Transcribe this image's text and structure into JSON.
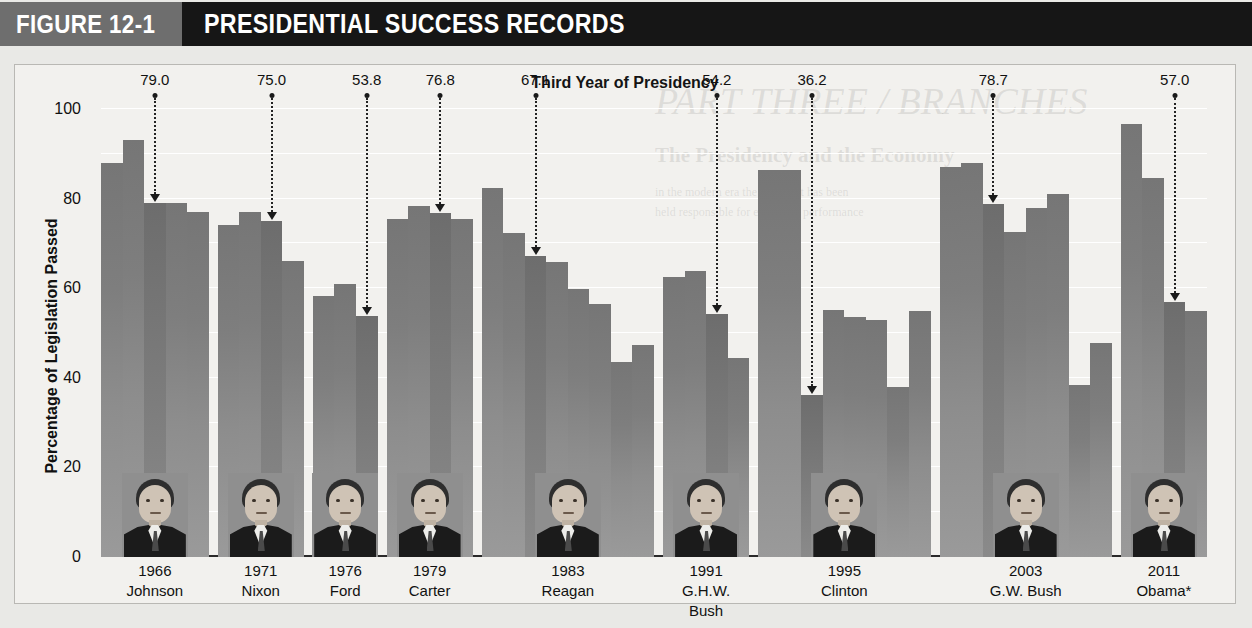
{
  "header": {
    "figure_number": "FIGURE 12-1",
    "figure_title": "PRESIDENTIAL SUCCESS RECORDS",
    "num_block_color": "#6e6e6e",
    "title_block_color": "#161616"
  },
  "background_text": {
    "line1": "PART THREE / BRANCHES",
    "line2": "The Presidency and the Economy",
    "line3": "in the modern era the president has been",
    "line4": "held responsible for economic performance"
  },
  "chart_data": {
    "type": "bar",
    "title": "Third Year of Presidency",
    "xlabel": "",
    "ylabel": "Percentage of Legislation Passed",
    "ylim": [
      0,
      100
    ],
    "yticks": [
      0,
      20,
      40,
      60,
      80,
      100
    ],
    "grid": true,
    "gridlines_minor": [
      10,
      30,
      50,
      70,
      90
    ],
    "legend_position": "none",
    "bar_color": "#8a8a8a",
    "footnote_marker": "*",
    "groups": [
      {
        "year": "1966",
        "president": "Johnson",
        "highlight_index": 2,
        "highlight_value": 79.0,
        "values": [
          88.0,
          93.0,
          79.0,
          79.0,
          77.0
        ]
      },
      {
        "year": "1971",
        "president": "Nixon",
        "highlight_index": 2,
        "highlight_value": 75.0,
        "values": [
          74.0,
          77.0,
          75.0,
          66.0
        ]
      },
      {
        "year": "1976",
        "president": "Ford",
        "highlight_index": 2,
        "highlight_value": 53.8,
        "values": [
          58.2,
          61.0,
          53.8
        ]
      },
      {
        "year": "1979",
        "president": "Carter",
        "highlight_index": 2,
        "highlight_value": 76.8,
        "values": [
          75.4,
          78.3,
          76.8,
          75.4
        ]
      },
      {
        "year": "1983",
        "president": "Reagan",
        "highlight_index": 2,
        "highlight_value": 67.1,
        "values": [
          82.4,
          72.4,
          67.1,
          65.8,
          59.9,
          56.5,
          43.5,
          47.4
        ]
      },
      {
        "year": "1991",
        "president": "G.H.W. Bush",
        "highlight_index": 2,
        "highlight_value": 54.2,
        "values": [
          62.6,
          63.9,
          54.2,
          44.5
        ]
      },
      {
        "year": "1995",
        "president": "Clinton",
        "highlight_index": 2,
        "highlight_value": 36.2,
        "values": [
          86.4,
          86.4,
          36.2,
          55.1,
          53.6,
          52.9,
          38.0,
          55.0
        ]
      },
      {
        "year": "2003",
        "president": "G.W. Bush",
        "highlight_index": 2,
        "highlight_value": 78.7,
        "values": [
          87.0,
          88.0,
          78.7,
          72.6,
          78.0,
          81.0,
          38.3,
          47.8
        ]
      },
      {
        "year": "2011",
        "president": "Obama*",
        "highlight_index": 2,
        "highlight_value": 57.0,
        "values": [
          96.7,
          84.6,
          57.0,
          55.0
        ]
      }
    ]
  }
}
